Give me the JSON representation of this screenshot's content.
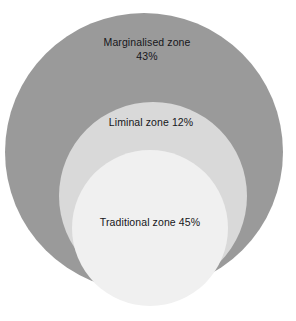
{
  "figure": {
    "type": "nested-proportional-circles",
    "background_color": "#ffffff",
    "label_text_color": "#16161a"
  },
  "chart_data": {
    "type": "pie",
    "title": "",
    "subtitle": "",
    "xlabel": "",
    "ylabel": "",
    "legend_position": "inside-shapes",
    "grid": false,
    "categories": [
      "Marginalised zone",
      "Liminal zone",
      "Traditional zone"
    ],
    "values": [
      43,
      12,
      45
    ],
    "value_unit": "%",
    "annotations": [
      "Marginalised zone 43%",
      "Liminal zone 12%",
      "Traditional zone 45%"
    ]
  },
  "zones": [
    {
      "id": "marginalised",
      "name": "Marginalised zone",
      "percent": "43%",
      "label_lines": [
        "Marginalised zone",
        "43%"
      ],
      "color": "#9a9a9a",
      "cx": 144,
      "cy": 152,
      "r": 139,
      "label_x": 147,
      "label_y": 49
    },
    {
      "id": "liminal",
      "name": "Liminal zone",
      "percent": "12%",
      "label_lines": [
        "Liminal zone 12%"
      ],
      "color": "#d9d9d9",
      "cx": 153,
      "cy": 196,
      "r": 94,
      "label_x": 151,
      "label_y": 123
    },
    {
      "id": "traditional",
      "name": "Traditional zone",
      "percent": "45%",
      "label_lines": [
        "Traditional zone 45%"
      ],
      "color": "#f0f0f0",
      "cx": 150,
      "cy": 228,
      "r": 78,
      "label_x": 150,
      "label_y": 223
    }
  ],
  "labels": {
    "marginalised_line1": "Marginalised zone",
    "marginalised_line2": "43%",
    "liminal_line1": "Liminal zone 12%",
    "traditional_line1": "Traditional zone 45%"
  }
}
